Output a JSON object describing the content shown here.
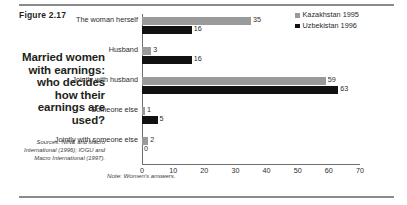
{
  "figure": {
    "number_label": "Figure 2.17",
    "headline": "Married women with earnings: who decides how their earnings are used?",
    "sources": "Sources: NINK and Macro International (1996); IOGU and Macro International (1997).",
    "note": "Note: Women's answers."
  },
  "chart_data": {
    "type": "bar",
    "orientation": "horizontal",
    "title": "Married women with earnings: who decides how their earnings are used?",
    "categories": [
      "The woman herself",
      "Husband",
      "Jointly with husband",
      "Someone else",
      "Jointly with someone else"
    ],
    "series": [
      {
        "name": "Kazakhstan 1995",
        "color": "#9a9a9a",
        "values": [
          35,
          3,
          59,
          1,
          2
        ]
      },
      {
        "name": "Uzbekistan 1996",
        "color": "#111111",
        "values": [
          16,
          16,
          63,
          5,
          0
        ]
      }
    ],
    "xlabel": "",
    "ylabel": "",
    "xlim": [
      0,
      70
    ],
    "xticks": [
      0,
      10,
      20,
      30,
      40,
      50,
      60,
      70
    ],
    "grid": false,
    "legend_position": "top-right",
    "annotations": [
      "Note: Women's answers."
    ]
  },
  "legend": {
    "items": [
      {
        "label": "Kazakhstan 1995",
        "color": "#9a9a9a"
      },
      {
        "label": "Uzbekistan 1996",
        "color": "#111111"
      }
    ]
  },
  "colors": {
    "series_1": "#9a9a9a",
    "series_2": "#111111",
    "rule": "#8a8a8a",
    "text": "#231f20"
  }
}
